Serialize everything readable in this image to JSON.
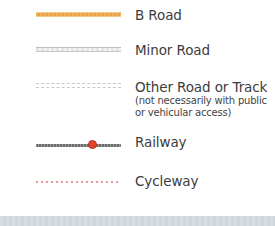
{
  "legend": {
    "items": [
      {
        "label": "B Road",
        "symbol": "b-road-line",
        "color": "#eeae5a"
      },
      {
        "label": "Minor Road",
        "symbol": "minor-road-line",
        "color": "#c6c6c6"
      },
      {
        "label": "Other Road or Track",
        "sublabel_line1": "(not necessarily with public",
        "sublabel_line2": "or vehicular access)",
        "symbol": "other-road-dashed-line",
        "color": "#c8c8c8"
      },
      {
        "label": "Railway",
        "symbol": "railway-line-with-station",
        "color": "#6c6c6c",
        "station_color": "#e2452f"
      },
      {
        "label": "Cycleway",
        "symbol": "cycleway-dotted-line",
        "color": "#e79aa0"
      }
    ]
  }
}
